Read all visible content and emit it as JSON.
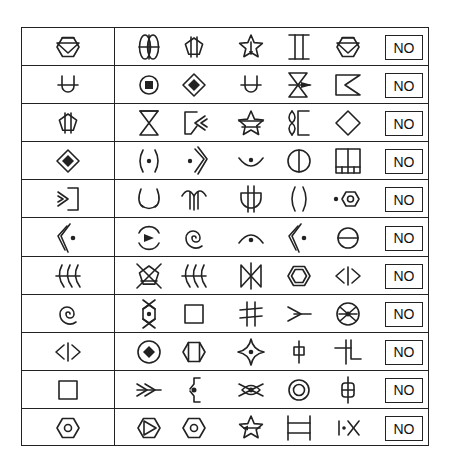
{
  "table": {
    "stroke_color": "#222222",
    "rows": [
      {
        "target": "hexagon-inverted-triangle",
        "options": [
          "double-ellipse-cross",
          "pentagon-bars",
          "star-arrow",
          "i-beam",
          "hexagon-inverted-triangle"
        ],
        "answer": "NO"
      },
      {
        "target": "u-crossbar",
        "options": [
          "circle-square",
          "diamond-filled",
          "u-crossbar",
          "hourglass-arrow",
          "flag-notch"
        ],
        "answer": "NO"
      },
      {
        "target": "pentagon-bars",
        "options": [
          "hourglass",
          "box-chevrons",
          "star-bar",
          "bracket-twist",
          "diamond"
        ],
        "answer": "NO"
      },
      {
        "target": "diamond-filled",
        "options": [
          "paren-dot",
          "chevron-dot",
          "smile-dot",
          "circle-vertical",
          "grid-box"
        ],
        "answer": "NO"
      },
      {
        "target": "arrow-bracket",
        "options": [
          "cup-curve",
          "double-arch",
          "trident-cup",
          "parens",
          "dot-hexagon"
        ],
        "answer": "NO"
      },
      {
        "target": "double-chevron-dot",
        "options": [
          "circle-arrow",
          "spiral",
          "arc-dot",
          "double-chevron-dot",
          "circle-horizontal"
        ],
        "answer": "NO"
      },
      {
        "target": "double-hook",
        "options": [
          "pentagon-cross",
          "double-hook",
          "bowtie",
          "hexagon-double",
          "angle-bar"
        ],
        "answer": "NO"
      },
      {
        "target": "spiral",
        "options": [
          "hexagon-dot-cross",
          "square",
          "hash",
          "arrow-v",
          "circle-x"
        ],
        "answer": "NO"
      },
      {
        "target": "angle-bar",
        "options": [
          "circle-diamond",
          "hexagon-bars",
          "star4-dot",
          "phi-small",
          "step-cross"
        ],
        "answer": "NO"
      },
      {
        "target": "square",
        "options": [
          "double-arrow",
          "bracket-dot",
          "eye-cross",
          "double-circle",
          "phi-cross"
        ],
        "answer": "NO"
      },
      {
        "target": "hexagon-circle",
        "options": [
          "hexagon-play",
          "hexagon-circle",
          "star-arrow-left",
          "h-bars",
          "bar-dot-x"
        ],
        "answer": "NO"
      }
    ]
  }
}
